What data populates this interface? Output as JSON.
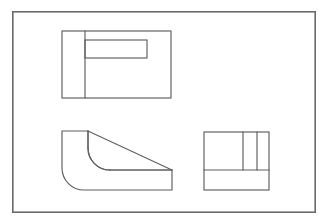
{
  "document": {
    "type": "engineering-drawing",
    "title": "Orthographic Multiview Drawing",
    "description": "Three-view orthographic projection of a filleted L-bracket with a central slot",
    "background_color": "#ffffff",
    "line_color": "#5e5e5e",
    "border_color": "#6a6a6a",
    "projection": "third-angle",
    "sheet_border": {
      "x": 12,
      "y": 11,
      "width": 304,
      "height": 202
    }
  },
  "views": [
    {
      "id": "top-view",
      "name": "top-view",
      "label": "Top View",
      "outline": {
        "x": 62,
        "y": 31,
        "width": 109,
        "height": 67
      },
      "features": [
        {
          "name": "vertical-edge-line",
          "type": "line",
          "x1": 85,
          "y1": 31,
          "x2": 85,
          "y2": 98
        },
        {
          "name": "slot-rectangle",
          "type": "rect",
          "x": 85,
          "y": 40,
          "width": 62,
          "height": 18
        }
      ]
    },
    {
      "id": "front-view",
      "name": "front-view",
      "label": "Front View",
      "outline_path": "M 62 131 L 88 131 L 88 148 A 22 22 0 0 0 110 170 L 172 170 L 172 190 L 84 190 A 22 22 0 0 1 62 168 Z",
      "features": [
        {
          "name": "fillet-outer-arc",
          "type": "arc",
          "center_x": 84,
          "center_y": 168,
          "radius": 22,
          "start": "left-vertical",
          "end": "bottom-horizontal"
        },
        {
          "name": "fillet-inner-arc",
          "type": "arc",
          "center_x": 110,
          "center_y": 148,
          "radius": 22,
          "start": "inner-vertical",
          "end": "inner-horizontal"
        },
        {
          "name": "chamfer-diagonal-edge",
          "type": "line",
          "x1": 88,
          "y1": 131,
          "x2": 172,
          "y2": 170
        },
        {
          "name": "base-top-edge-line",
          "type": "line",
          "x1": 110,
          "y1": 170,
          "x2": 172,
          "y2": 170
        }
      ]
    },
    {
      "id": "side-view",
      "name": "side-view",
      "label": "Right Side View",
      "outline": {
        "x": 204,
        "y": 132,
        "width": 65,
        "height": 58
      },
      "features": [
        {
          "name": "horizontal-divider-line",
          "type": "line",
          "x1": 204,
          "y1": 170,
          "x2": 269,
          "y2": 170
        },
        {
          "name": "vertical-divider-line-1",
          "type": "line",
          "x1": 243,
          "y1": 132,
          "x2": 243,
          "y2": 170
        },
        {
          "name": "vertical-divider-line-2",
          "type": "line",
          "x1": 257,
          "y1": 132,
          "x2": 257,
          "y2": 170
        }
      ]
    }
  ]
}
